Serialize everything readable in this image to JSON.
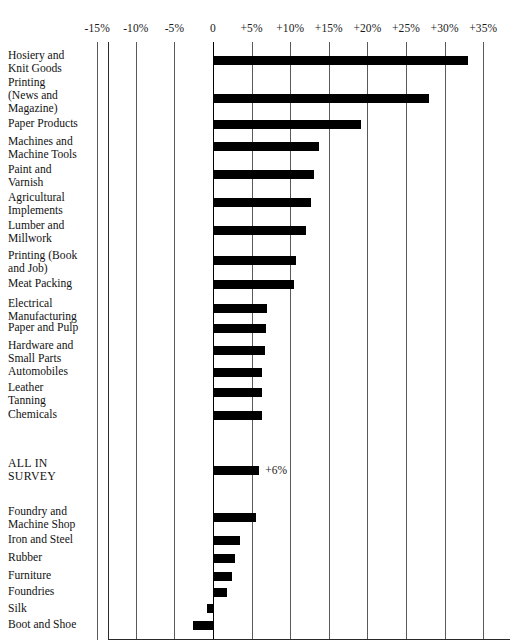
{
  "chart_data": {
    "type": "bar",
    "orientation": "horizontal",
    "title": "",
    "xlabel": "",
    "ylabel": "",
    "xlim": [
      -17.5,
      37.5
    ],
    "grid": true,
    "legend": null,
    "axis": {
      "ticks": [
        -15,
        -10,
        -5,
        0,
        5,
        10,
        15,
        20,
        25,
        30,
        35
      ],
      "tick_labels": [
        "-15%",
        "-10%",
        "-5%",
        "0",
        "+5%",
        "+10%",
        "+15%",
        "+20%",
        "+25%",
        "+30%",
        "+35%"
      ]
    },
    "groups": [
      {
        "name": "above-average",
        "categories": [
          "Hosiery and\nKnit Goods",
          "Printing\n(News and\nMagazine)",
          "Paper Products",
          "Machines and\nMachine Tools",
          "Paint and\nVarnish",
          "Agricultural\nImplements",
          "Lumber and\nMillwork",
          "Printing (Book\nand Job)",
          "Meat Packing",
          "Electrical\nManufacturing",
          "Paper and Pulp",
          "Hardware and\nSmall Parts",
          "Automobiles",
          "Leather\nTanning",
          "Chemicals"
        ],
        "values": [
          33.0,
          28.0,
          19.2,
          13.7,
          13.1,
          12.7,
          12.0,
          10.8,
          10.5,
          7.0,
          6.9,
          6.7,
          6.4,
          6.3,
          6.3
        ],
        "value_labels": [
          "",
          "",
          "",
          "",
          "",
          "",
          "",
          "",
          "",
          "",
          "",
          "",
          "",
          "",
          ""
        ]
      },
      {
        "name": "all-in-survey",
        "categories": [
          "ALL IN\nSURVEY"
        ],
        "values": [
          6.0
        ],
        "value_labels": [
          "+6%"
        ]
      },
      {
        "name": "below-average",
        "categories": [
          "Foundry and\nMachine Shop",
          "Iron and Steel",
          "Rubber",
          "Furniture",
          "Foundries",
          "Silk",
          "Boot and Shoe"
        ],
        "values": [
          5.6,
          3.5,
          2.9,
          2.5,
          1.8,
          -0.8,
          -2.6
        ],
        "value_labels": [
          "",
          "",
          "",
          "",
          "",
          "",
          ""
        ]
      }
    ],
    "colors": {
      "bar": "#000000",
      "gridline": "#5a5a5a",
      "axis": "#000000",
      "background": "#ffffff",
      "text": "#111111"
    }
  }
}
